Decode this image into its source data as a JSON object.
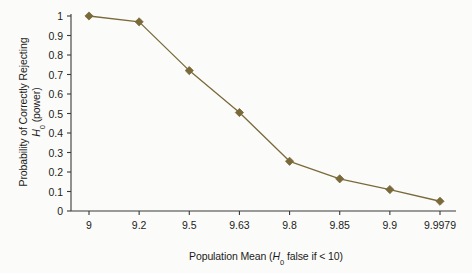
{
  "chart_data": {
    "type": "line",
    "title": "",
    "categories": [
      "9",
      "9.2",
      "9.5",
      "9.63",
      "9.8",
      "9.85",
      "9.9",
      "9.9979"
    ],
    "values": [
      1,
      0.97,
      0.72,
      0.505,
      0.255,
      0.165,
      0.11,
      0.05
    ],
    "series": [
      {
        "name": "power",
        "values": [
          1,
          0.97,
          0.72,
          0.505,
          0.255,
          0.165,
          0.11,
          0.05
        ]
      }
    ],
    "xlabel_parts": {
      "pre": "Population Mean (",
      "symbol": "H",
      "subscript": "0",
      "post": " false if < 10)"
    },
    "xlabel_plain": "Population Mean (H0 false if < 10)",
    "ylabel_line1": "Probability of Correctly Rejecting",
    "ylabel_line2_parts": {
      "symbol": "H",
      "subscript": "0",
      "post": " (power)"
    },
    "ylabel_plain": "Probability of Correctly Rejecting H0 (power)",
    "ytick_labels": [
      "0",
      "0.1",
      "0.2",
      "0.3",
      "0.4",
      "0.5",
      "0.6",
      "0.7",
      "0.8",
      "0.9",
      "1"
    ],
    "ytick_values": [
      0,
      0.1,
      0.2,
      0.3,
      0.4,
      0.5,
      0.6,
      0.7,
      0.8,
      0.9,
      1
    ],
    "ylim": [
      0,
      1
    ],
    "grid": false,
    "legend": "none",
    "marker": "diamond",
    "colors": {
      "line": "#7a6a3a",
      "marker": "#7a6a3a",
      "axis": "#3a3a3a",
      "text": "#1b1b1b",
      "background": "#fbfbf9"
    }
  }
}
